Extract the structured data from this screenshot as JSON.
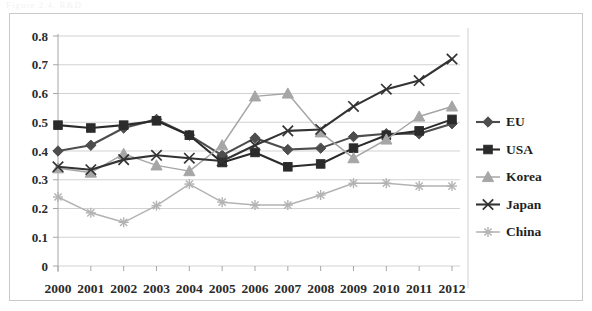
{
  "figure": {
    "top_artifact_text": "Figure 2.4.  R&D",
    "background_color": "#ffffff",
    "border_color": "#c9c9c9"
  },
  "chart_data": {
    "type": "line",
    "title": "",
    "subtitle": "",
    "xlabel": "",
    "ylabel": "",
    "categories": [
      "2000",
      "2001",
      "2002",
      "2003",
      "2004",
      "2005",
      "2006",
      "2007",
      "2008",
      "2009",
      "2010",
      "2011",
      "2012"
    ],
    "x": [
      2000,
      2001,
      2002,
      2003,
      2004,
      2005,
      2006,
      2007,
      2008,
      2009,
      2010,
      2011,
      2012
    ],
    "ylim": [
      0,
      0.8
    ],
    "xlim": [
      2000,
      2012
    ],
    "ytick_labels": [
      "0.8",
      "0.7",
      "0.6",
      "0.5",
      "0.4",
      "0.3",
      "0.2",
      "0.1",
      "0"
    ],
    "ytick_values": [
      0.8,
      0.7,
      0.6,
      0.5,
      0.4,
      0.3,
      0.2,
      0.1,
      0
    ],
    "grid": true,
    "grid_axis": "y",
    "legend_position": "right",
    "series": [
      {
        "name": "EU",
        "marker": "diamond",
        "color": "#4d4d4d",
        "values": [
          0.4,
          0.42,
          0.48,
          0.51,
          0.455,
          0.385,
          0.445,
          0.405,
          0.41,
          0.45,
          0.46,
          0.46,
          0.495
        ]
      },
      {
        "name": "USA",
        "marker": "square",
        "color": "#2b2b2b",
        "values": [
          0.49,
          0.48,
          0.49,
          0.505,
          0.455,
          0.36,
          0.395,
          0.345,
          0.355,
          0.41,
          0.455,
          0.47,
          0.51
        ]
      },
      {
        "name": "Korea",
        "marker": "triangle",
        "color": "#a6a6a6",
        "values": [
          0.34,
          0.325,
          0.39,
          0.35,
          0.33,
          0.42,
          0.59,
          0.6,
          0.465,
          0.375,
          0.44,
          0.52,
          0.555
        ]
      },
      {
        "name": "Japan",
        "marker": "cross",
        "color": "#333333",
        "values": [
          0.345,
          0.335,
          0.37,
          0.385,
          0.375,
          0.365,
          0.42,
          0.47,
          0.475,
          0.555,
          0.615,
          0.645,
          0.72
        ]
      },
      {
        "name": "China",
        "marker": "asterisk",
        "color": "#b3b3b3",
        "values": [
          0.24,
          0.185,
          0.152,
          0.21,
          0.285,
          0.222,
          0.212,
          0.212,
          0.247,
          0.288,
          0.288,
          0.278,
          0.278
        ]
      }
    ],
    "legend_entries": [
      {
        "label": "EU",
        "marker": "diamond",
        "color": "#4d4d4d"
      },
      {
        "label": "USA",
        "marker": "square",
        "color": "#2b2b2b"
      },
      {
        "label": "Korea",
        "marker": "triangle",
        "color": "#a6a6a6"
      },
      {
        "label": "Japan",
        "marker": "cross",
        "color": "#333333"
      },
      {
        "label": "China",
        "marker": "asterisk",
        "color": "#b3b3b3"
      }
    ]
  }
}
